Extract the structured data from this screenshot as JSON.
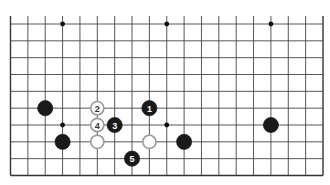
{
  "diagram": {
    "type": "go-board-partial",
    "board_size": 19,
    "visible_columns": 19,
    "visible_rows": 10,
    "top_open": true,
    "colors": {
      "background": "#ffffff",
      "grid": "#444444",
      "black_stone": "#1a1a1a",
      "white_stone_fill": "#ffffff",
      "white_stone_outline": "#9a9a9a"
    },
    "star_points": [
      {
        "col": 3,
        "row": 0
      },
      {
        "col": 9,
        "row": 0
      },
      {
        "col": 15,
        "row": 0
      },
      {
        "col": 3,
        "row": 6
      },
      {
        "col": 9,
        "row": 6
      },
      {
        "col": 15,
        "row": 6
      }
    ],
    "stones": [
      {
        "color": "black",
        "col": 2,
        "row": 5,
        "label": ""
      },
      {
        "color": "white",
        "col": 5,
        "row": 5,
        "label": "2"
      },
      {
        "color": "black",
        "col": 8,
        "row": 5,
        "label": "1"
      },
      {
        "color": "white",
        "col": 5,
        "row": 6,
        "label": "4"
      },
      {
        "color": "black",
        "col": 6,
        "row": 6,
        "label": "3"
      },
      {
        "color": "black",
        "col": 15,
        "row": 6,
        "label": ""
      },
      {
        "color": "black",
        "col": 3,
        "row": 7,
        "label": ""
      },
      {
        "color": "white",
        "col": 5,
        "row": 7,
        "label": ""
      },
      {
        "color": "white",
        "col": 8,
        "row": 7,
        "label": ""
      },
      {
        "color": "black",
        "col": 10,
        "row": 7,
        "label": ""
      },
      {
        "color": "black",
        "col": 7,
        "row": 8,
        "label": "5"
      }
    ]
  }
}
